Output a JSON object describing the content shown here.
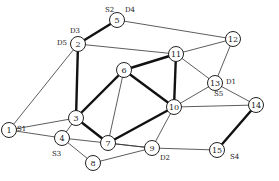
{
  "diagram": {
    "type": "network-graph",
    "nodes": [
      {
        "id": "1",
        "x": 9,
        "y": 130
      },
      {
        "id": "2",
        "x": 78,
        "y": 44
      },
      {
        "id": "3",
        "x": 76,
        "y": 118
      },
      {
        "id": "4",
        "x": 62,
        "y": 138
      },
      {
        "id": "5",
        "x": 117,
        "y": 20
      },
      {
        "id": "6",
        "x": 124,
        "y": 70
      },
      {
        "id": "7",
        "x": 108,
        "y": 143
      },
      {
        "id": "8",
        "x": 93,
        "y": 163
      },
      {
        "id": "9",
        "x": 152,
        "y": 148
      },
      {
        "id": "10",
        "x": 174,
        "y": 107
      },
      {
        "id": "11",
        "x": 176,
        "y": 54
      },
      {
        "id": "12",
        "x": 233,
        "y": 39
      },
      {
        "id": "13",
        "x": 215,
        "y": 83
      },
      {
        "id": "14",
        "x": 256,
        "y": 105
      },
      {
        "id": "15",
        "x": 217,
        "y": 150
      }
    ],
    "edges": [
      {
        "from": "5",
        "to": "2",
        "bold": true
      },
      {
        "from": "5",
        "to": "12",
        "bold": false
      },
      {
        "from": "2",
        "to": "11",
        "bold": false
      },
      {
        "from": "2",
        "to": "3",
        "bold": true
      },
      {
        "from": "2",
        "to": "1",
        "bold": false
      },
      {
        "from": "1",
        "to": "3",
        "bold": false
      },
      {
        "from": "1",
        "to": "4",
        "bold": false
      },
      {
        "from": "3",
        "to": "4",
        "bold": false
      },
      {
        "from": "3",
        "to": "6",
        "bold": true
      },
      {
        "from": "3",
        "to": "7",
        "bold": true
      },
      {
        "from": "6",
        "to": "11",
        "bold": true
      },
      {
        "from": "6",
        "to": "10",
        "bold": true
      },
      {
        "from": "6",
        "to": "7",
        "bold": false
      },
      {
        "from": "7",
        "to": "10",
        "bold": true
      },
      {
        "from": "7",
        "to": "9",
        "bold": false
      },
      {
        "from": "11",
        "to": "10",
        "bold": true
      },
      {
        "from": "11",
        "to": "12",
        "bold": false
      },
      {
        "from": "11",
        "to": "13",
        "bold": false
      },
      {
        "from": "12",
        "to": "13",
        "bold": false
      },
      {
        "from": "13",
        "to": "10",
        "bold": false
      },
      {
        "from": "13",
        "to": "14",
        "bold": false
      },
      {
        "from": "10",
        "to": "14",
        "bold": false
      },
      {
        "from": "10",
        "to": "9",
        "bold": false
      },
      {
        "from": "4",
        "to": "9",
        "bold": false
      },
      {
        "from": "4",
        "to": "8",
        "bold": false
      },
      {
        "from": "8",
        "to": "9",
        "bold": false
      },
      {
        "from": "9",
        "to": "15",
        "bold": false
      },
      {
        "from": "14",
        "to": "15",
        "bold": true
      }
    ],
    "labels": [
      {
        "text": "S2",
        "x": 105,
        "y": 12
      },
      {
        "text": "D4",
        "x": 125,
        "y": 12
      },
      {
        "text": "D3",
        "x": 70,
        "y": 33
      },
      {
        "text": "D5",
        "x": 57,
        "y": 45
      },
      {
        "text": "S1",
        "x": 17,
        "y": 131
      },
      {
        "text": "S3",
        "x": 52,
        "y": 156
      },
      {
        "text": "D1",
        "x": 226,
        "y": 84
      },
      {
        "text": "S5",
        "x": 214,
        "y": 96
      },
      {
        "text": "D2",
        "x": 160,
        "y": 160
      },
      {
        "text": "S4",
        "x": 230,
        "y": 159
      }
    ]
  }
}
